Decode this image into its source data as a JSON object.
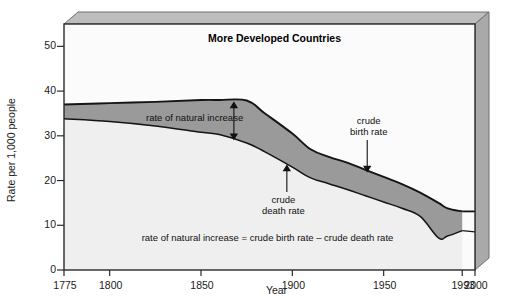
{
  "chart_data": {
    "type": "area",
    "title": "More Developed Countries",
    "xlabel": "Year",
    "ylabel": "Rate per 1,000 people",
    "xlim": [
      1775,
      2000
    ],
    "ylim": [
      0,
      55
    ],
    "ytick_values": [
      0,
      10,
      20,
      30,
      40,
      50
    ],
    "ytick_labels": [
      "0",
      "10",
      "20",
      "30",
      "40",
      "50"
    ],
    "xtick_values": [
      1775,
      1800,
      1850,
      1900,
      1950,
      1993,
      2000
    ],
    "xtick_labels": [
      "1775",
      "1800",
      "1850",
      "1900",
      "1950",
      "1993",
      "2000"
    ],
    "grid": false,
    "legend": "none",
    "x": [
      1775,
      1800,
      1825,
      1850,
      1860,
      1875,
      1885,
      1900,
      1910,
      1920,
      1930,
      1940,
      1950,
      1960,
      1970,
      1980,
      1985,
      1993
    ],
    "series": [
      {
        "name": "crude birth rate",
        "values": [
          37.0,
          37.3,
          37.6,
          38.0,
          38.0,
          37.9,
          35.0,
          30.5,
          27.0,
          25.3,
          24.0,
          22.4,
          20.8,
          19.2,
          17.3,
          15.0,
          13.8,
          13.1
        ],
        "color": "#1a1a1a"
      },
      {
        "name": "crude death rate",
        "values": [
          33.8,
          33.2,
          32.2,
          30.8,
          30.3,
          28.4,
          26.4,
          23.0,
          20.6,
          19.3,
          18.0,
          16.6,
          15.2,
          13.8,
          12.0,
          7.2,
          7.6,
          8.8
        ],
        "color": "#1a1a1a"
      }
    ],
    "band": {
      "name": "rate of natural increase",
      "between": [
        "crude birth rate",
        "crude death rate"
      ],
      "fill_color": "#9a9a9a"
    },
    "under_fill_color": "#efefef",
    "annotations": [
      {
        "name": "rate-of-natural-increase",
        "text": "rate of natural increase",
        "arrow": "double-vertical"
      },
      {
        "name": "crude-death-rate",
        "text_line1": "crude",
        "text_line2": "death rate",
        "arrow": "up"
      },
      {
        "name": "crude-birth-rate",
        "text_line1": "crude",
        "text_line2": "birth rate",
        "arrow": "down"
      }
    ],
    "formula": "rate of natural increase = crude birth rate – crude death rate"
  },
  "frame": {
    "bevel_top_color": "#b9b9b9",
    "bevel_right_color": "#a8a8a8",
    "border_color": "#2a2a2a"
  }
}
